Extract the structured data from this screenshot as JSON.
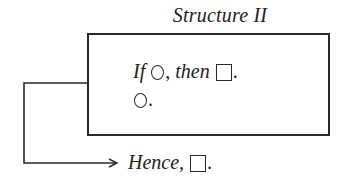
{
  "diagram": {
    "title": "Structure II",
    "premises": {
      "line1": {
        "if_word": "If",
        "antecedent_symbol": "circle",
        "comma": ",",
        "then_word": "then",
        "consequent_symbol": "square",
        "period": "."
      },
      "line2": {
        "symbol": "circle",
        "period": "."
      }
    },
    "conclusion": {
      "hence_word": "Hence,",
      "symbol": "square",
      "period": "."
    },
    "colors": {
      "stroke": "#2a2a2a",
      "text": "#222222",
      "background": "#ffffff"
    }
  }
}
